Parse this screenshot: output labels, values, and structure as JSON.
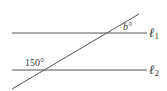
{
  "diagram": {
    "lines": [
      {
        "name": "line-l1",
        "label": "ℓ",
        "subscript": "1",
        "x1": 12,
        "y1": 33,
        "x2": 147,
        "y2": 33
      },
      {
        "name": "line-l2",
        "label": "ℓ",
        "subscript": "2",
        "x1": 12,
        "y1": 70,
        "x2": 147,
        "y2": 70
      },
      {
        "name": "transversal",
        "x1": 12,
        "y1": 89,
        "x2": 139,
        "y2": 14
      }
    ],
    "angles": [
      {
        "name": "angle-b",
        "label": "b°"
      },
      {
        "name": "angle-150",
        "label": "150°"
      }
    ],
    "stroke_color": "#555555"
  }
}
